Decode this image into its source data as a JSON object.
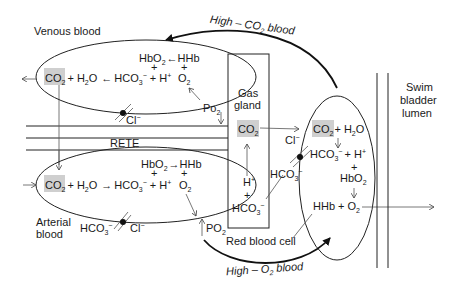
{
  "labels": {
    "venous_blood": "Venous blood",
    "arterial_blood": "Arterial blood",
    "arterial_blood_line1": "Arterial",
    "arterial_blood_line2": "blood",
    "rete": "RETE",
    "gas_gland_line1": "Gas",
    "gas_gland_line2": "gland",
    "swim_bladder_line1": "Swim",
    "swim_bladder_line2": "bladder",
    "swim_bladder_line3": "lumen",
    "red_blood_cell": "Red blood cell",
    "high_co2_blood_prefix": "High – CO",
    "high_co2_blood_sub": "2",
    "high_co2_blood_suffix": " blood",
    "high_o2_blood_prefix": "High – O",
    "high_o2_blood_sub": "2",
    "high_o2_blood_suffix": " blood"
  },
  "venous": {
    "co2": "CO",
    "co2_sub": "2",
    "h2o": "+ H",
    "h2o_sub": "2",
    "h2o_tail": "O",
    "arrow": "←",
    "hco3": "HCO",
    "hco3_sub": "3",
    "hco3_sup": "−",
    "plus_h": "+ H",
    "plus_h_sup": "+",
    "hbo2": "HbO",
    "hbo2_sub": "2",
    "hhb_arrow": "←",
    "hhb": "HHb",
    "plus": "+",
    "o2": "O",
    "o2_sub": "2",
    "po2": "Po",
    "po2_sub": "2",
    "cl": "Cl",
    "cl_sup": "−"
  },
  "arterial": {
    "co2": "CO",
    "co2_sub": "2",
    "h2o": "+ H",
    "h2o_sub": "2",
    "h2o_tail": "O",
    "arrow": "→",
    "hco3": "HCO",
    "hco3_sub": "3",
    "hco3_sup": "−",
    "plus_h": "+ H",
    "plus_h_sup": "+",
    "hbo2": "HbO",
    "hbo2_sub": "2",
    "hhb_arrow": "→",
    "hhb": "HHb",
    "plus": "+",
    "o2": "O",
    "o2_sub": "2",
    "po2": "PO",
    "po2_sub": "2",
    "hco3_ex": "HCO",
    "hco3_ex_sub": "3",
    "hco3_ex_sup": "−",
    "cl": "Cl",
    "cl_sup": "−"
  },
  "gland": {
    "co2": "CO",
    "co2_sub": "2",
    "h": "H",
    "h_sup": "+",
    "plus": "+",
    "hco3": "HCO",
    "hco3_sub": "3",
    "hco3_sup": "−"
  },
  "rbc": {
    "co2": "CO",
    "co2_sub": "2",
    "h2o": "+ H",
    "h2o_sub": "2",
    "h2o_tail": "O",
    "hco3": "HCO",
    "hco3_sub": "3",
    "hco3_sup": "−",
    "plus_h": "+ H",
    "plus_h_sup": "+",
    "plus": "+",
    "hbo2": "HbO",
    "hbo2_sub": "2",
    "hhb_o2": "HHb + O",
    "hhb_o2_sub": "2",
    "cl": "Cl",
    "cl_sup": "−",
    "hco3_ex": "HCO",
    "hco3_ex_sub": "3",
    "hco3_ex_sup": "−"
  },
  "colors": {
    "highlight": "#cfcfcf",
    "line": "#222222",
    "background": "#ffffff"
  }
}
